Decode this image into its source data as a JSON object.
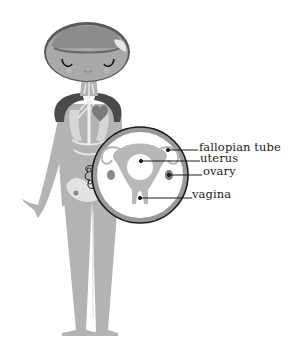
{
  "figure": {
    "colors": {
      "background": "#ffffff",
      "body": "#b3b3b3",
      "head": "#a6a6a6",
      "head_dark": "#5a5a5a",
      "shoulders": "#4a4a4a",
      "organs_light": "#e6e6e6",
      "line": "#1a1a1a",
      "magnifier_ring": "#9a9a9a"
    }
  },
  "labels": [
    {
      "id": "fallopian_tube",
      "text": "fallopian tube"
    },
    {
      "id": "uterus",
      "text": "uterus"
    },
    {
      "id": "ovary",
      "text": "ovary"
    },
    {
      "id": "vagina",
      "text": "vagina"
    }
  ]
}
